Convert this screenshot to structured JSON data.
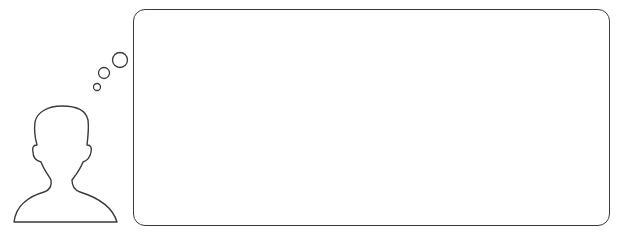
{
  "scene": {
    "description": "Thought-bubble illustration: outline of a person with three thought circles leading to an empty rounded rectangle",
    "stroke_color": "#3a3a3a",
    "background_color": "#ffffff"
  },
  "figure": {
    "icon": "person-silhouette-outline"
  },
  "thought_bubbles": [
    {
      "size": "small",
      "cx": 97,
      "cy": 87,
      "r": 3.5
    },
    {
      "size": "medium",
      "cx": 104,
      "cy": 73,
      "r": 5.5
    },
    {
      "size": "large",
      "cx": 120,
      "cy": 60,
      "r": 7.5
    }
  ],
  "text_box": {
    "content": ""
  }
}
